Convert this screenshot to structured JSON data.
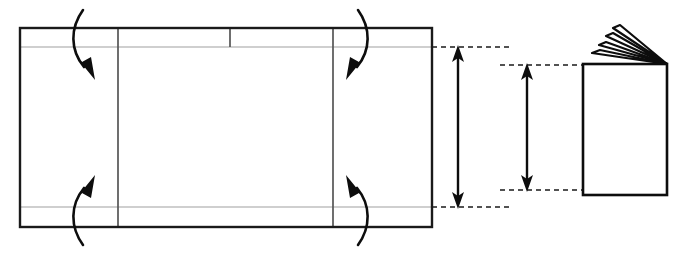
{
  "figure": {
    "canvas": {
      "width": 688,
      "height": 253
    },
    "colors": {
      "background": "#ffffff",
      "stroke": "#000000",
      "outline": "#1a1a1a",
      "fold_line": "#bfbfbf",
      "crease_line": "#4a4a4a",
      "dashed_guide": "#1a1a1a"
    }
  },
  "flat_sheet": {
    "label": "Unfolded flat sheet",
    "outline": {
      "x": 20,
      "y": 28,
      "width": 412,
      "height": 199
    },
    "horizontal_fold_lines": [
      {
        "name": "top-trim-fold",
        "y": 47,
        "x1": 20,
        "x2": 432
      },
      {
        "name": "bottom-trim-fold",
        "y": 207,
        "x1": 20,
        "x2": 432
      }
    ],
    "vertical_fold_lines": [
      {
        "name": "left-panel-crease",
        "x": 118,
        "y1": 28,
        "y2": 227,
        "full_height": true
      },
      {
        "name": "header-divider-crease",
        "x": 230,
        "y1": 28,
        "y2": 47,
        "full_height": false
      },
      {
        "name": "right-panel-crease",
        "x": 333,
        "y1": 28,
        "y2": 227,
        "full_height": true
      }
    ]
  },
  "fold_arrows": [
    {
      "name": "top-left-fold-arrow",
      "direction": "down",
      "bulge": "left",
      "start": [
        83,
        10
      ],
      "end": [
        91,
        78
      ]
    },
    {
      "name": "bottom-left-fold-arrow",
      "direction": "up",
      "bulge": "left",
      "start": [
        83,
        245
      ],
      "end": [
        91,
        177
      ]
    },
    {
      "name": "top-right-fold-arrow",
      "direction": "down",
      "bulge": "right",
      "start": [
        358,
        10
      ],
      "end": [
        350,
        78
      ]
    },
    {
      "name": "bottom-right-fold-arrow",
      "direction": "up",
      "bulge": "right",
      "start": [
        358,
        245
      ],
      "end": [
        350,
        177
      ]
    }
  ],
  "dimensions": [
    {
      "name": "untrimmed-height-dimension",
      "axis": "vertical",
      "x": 458,
      "y_top": 47,
      "y_bottom": 207,
      "double_headed": true,
      "guides": [
        {
          "name": "untrimmed-top-guide",
          "y": 47,
          "x1": 432,
          "x2": 512
        },
        {
          "name": "untrimmed-bottom-guide",
          "y": 207,
          "x1": 432,
          "x2": 512
        }
      ]
    },
    {
      "name": "finished-height-dimension",
      "axis": "vertical",
      "x": 527,
      "y_top": 65,
      "y_bottom": 190,
      "double_headed": true,
      "guides": [
        {
          "name": "finished-top-guide",
          "y": 65,
          "x1": 500,
          "x2": 585
        },
        {
          "name": "finished-bottom-guide",
          "y": 190,
          "x1": 500,
          "x2": 585
        }
      ]
    }
  ],
  "folded_booklet": {
    "label": "Finished folded booklet",
    "cover": {
      "x": 583,
      "y": 64,
      "width": 84,
      "height": 131
    },
    "spine_vertex": [
      667,
      64
    ],
    "fanned_pages": [
      {
        "name": "fan-page-1",
        "tip": [
          600,
          50
        ]
      },
      {
        "name": "fan-page-2",
        "tip": [
          606,
          42
        ]
      },
      {
        "name": "fan-page-3",
        "tip": [
          613,
          33
        ]
      },
      {
        "name": "fan-page-4",
        "tip": [
          620,
          25
        ]
      }
    ],
    "page_count": 4
  }
}
